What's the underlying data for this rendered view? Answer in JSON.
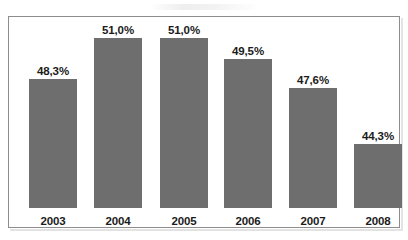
{
  "chart_data": {
    "type": "bar",
    "title": "",
    "subtitle": "",
    "xlabel": "",
    "ylabel": "",
    "categories": [
      "2003",
      "2004",
      "2005",
      "2006",
      "2007",
      "2008"
    ],
    "values": [
      48.3,
      51.0,
      51.0,
      49.5,
      47.6,
      44.3
    ],
    "value_labels": [
      "48,3%",
      "51,0%",
      "51,0%",
      "49,5%",
      "47,6%",
      "44,3%"
    ],
    "series": [
      {
        "name": "",
        "values": [
          48.3,
          51.0,
          51.0,
          49.5,
          47.6,
          44.3
        ]
      }
    ],
    "bar_color": "#6e6e6e",
    "grid": false,
    "legend": false,
    "legend_position": "none",
    "axis_visible": false,
    "frame": true,
    "ylim": [
      0,
      55
    ],
    "note": "Bar pixel heights are exaggerated relative to values (truncated baseline typical of scanned report figures)."
  },
  "bars": [
    {
      "label": "2003",
      "value_label": "48,3%",
      "height_px": 129,
      "left_px": 20
    },
    {
      "label": "2004",
      "value_label": "51,0%",
      "height_px": 170,
      "left_px": 85
    },
    {
      "label": "2005",
      "value_label": "51,0%",
      "height_px": 170,
      "left_px": 151
    },
    {
      "label": "2006",
      "value_label": "49,5%",
      "height_px": 149,
      "left_px": 215
    },
    {
      "label": "2007",
      "value_label": "47,6%",
      "height_px": 120,
      "left_px": 280
    },
    {
      "label": "2008",
      "value_label": "44,3%",
      "height_px": 64,
      "left_px": 345
    }
  ],
  "colors": {
    "bar": "#6e6e6e",
    "frame_border": "#8d8d8d",
    "text": "#1b1b1b",
    "background": "#ffffff"
  }
}
